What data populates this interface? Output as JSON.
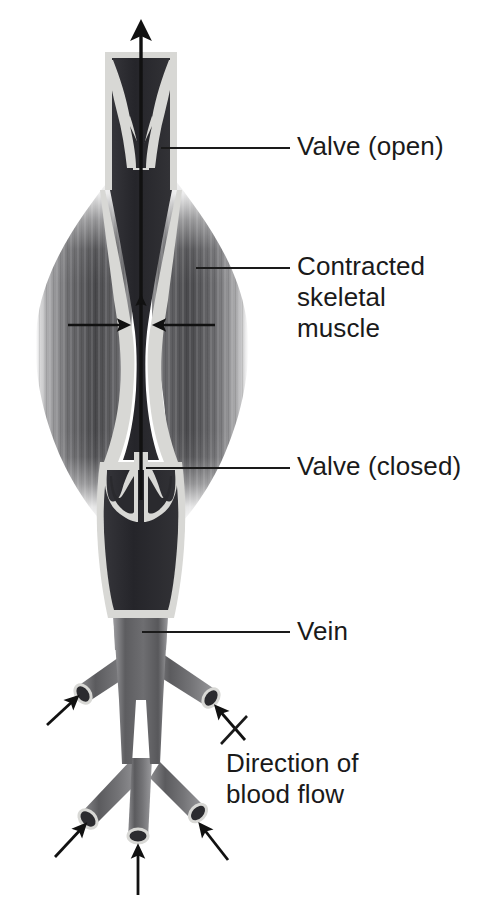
{
  "figure": {
    "background_color": "#ffffff",
    "width": 482,
    "height": 914
  },
  "labels": {
    "valve_open": "Valve (open)",
    "contracted_muscle_line1": "Contracted",
    "contracted_muscle_line2": "skeletal",
    "contracted_muscle_line3": "muscle",
    "valve_closed": "Valve (closed)",
    "vein": "Vein",
    "direction_line1": "Direction of",
    "direction_line2": "blood flow"
  },
  "colors": {
    "text": "#1a1a1a",
    "leader_line": "#1a1a1a",
    "arrow": "#111111",
    "vein_lumen_dark": "#2f2f33",
    "vein_wall_light": "#d9d9d6",
    "muscle_mid": "#6e6e70",
    "muscle_dark": "#3c3c3e",
    "muscle_fade": "#ffffff",
    "branch_vessel": "#6a6a6c"
  },
  "anatomy": {
    "vein_segments": [
      {
        "name": "upper-vein-segment",
        "description": "Vein above the open valve carrying blood upward"
      },
      {
        "name": "compressed-vein-segment",
        "description": "Vein squeezed flat between contracted muscle bellies"
      },
      {
        "name": "lower-vein-segment",
        "description": "Vein below the closed valve, filled with blood"
      },
      {
        "name": "vein-trunk",
        "description": "Vein trunk receiving tributary branches"
      }
    ],
    "valves": [
      {
        "name": "valve-open",
        "state": "open",
        "description": "Cusps swept aside allowing upward flow"
      },
      {
        "name": "valve-closed",
        "state": "closed",
        "description": "Cusps meeting in midline preventing backflow"
      }
    ],
    "muscles": [
      {
        "name": "left-skeletal-muscle",
        "state": "contracted"
      },
      {
        "name": "right-skeletal-muscle",
        "state": "contracted"
      }
    ],
    "branch_count": 5,
    "inflow_arrow_count": 5
  },
  "flow_arrows": [
    {
      "name": "main-upward-flow-arrow",
      "direction": "up",
      "style": "thick",
      "meaning": "Blood propelled toward the heart"
    },
    {
      "name": "compressed-segment-flow-arrow",
      "direction": "up",
      "style": "thin",
      "meaning": "Blood pushed upward out of squeezed vein"
    },
    {
      "name": "left-muscle-compression-arrow",
      "direction": "right",
      "style": "thin",
      "meaning": "Muscle presses on vein"
    },
    {
      "name": "right-muscle-compression-arrow",
      "direction": "left",
      "style": "thin",
      "meaning": "Muscle presses on vein"
    },
    {
      "name": "branch-inflow-arrow-upper-left",
      "direction": "up-right"
    },
    {
      "name": "branch-inflow-arrow-upper-right",
      "direction": "up-left"
    },
    {
      "name": "branch-inflow-arrow-lower-left",
      "direction": "up-right"
    },
    {
      "name": "branch-inflow-arrow-lower-center",
      "direction": "up"
    },
    {
      "name": "branch-inflow-arrow-lower-right",
      "direction": "up-left"
    }
  ],
  "leader_lines": [
    {
      "name": "leader-valve-open",
      "from": [
        161,
        148
      ],
      "to": [
        290,
        148
      ]
    },
    {
      "name": "leader-muscle",
      "from": [
        196,
        268
      ],
      "to": [
        290,
        268
      ]
    },
    {
      "name": "leader-valve-closed",
      "from": [
        146,
        468
      ],
      "to": [
        290,
        468
      ]
    },
    {
      "name": "leader-vein",
      "from": [
        142,
        632
      ],
      "to": [
        290,
        632
      ]
    },
    {
      "name": "leader-direction",
      "from": [
        222,
        742
      ],
      "to": [
        245,
        718
      ]
    }
  ]
}
